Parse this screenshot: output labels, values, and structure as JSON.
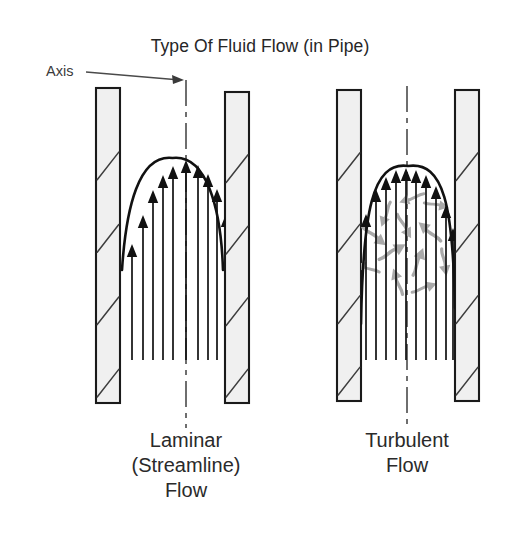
{
  "figure": {
    "title": "Type Of Fluid Flow (in Pipe)",
    "background_color": "#ffffff",
    "ink_color": "#111111",
    "wall_fill_color": "#f0f0f0",
    "eddy_color": "#a9a9a9",
    "axis_annotation": {
      "label": "Axis",
      "label_x": 46,
      "label_y": 76,
      "leader_from_x": 86,
      "leader_from_y": 72,
      "leader_to_x": 184,
      "leader_to_y": 80,
      "arrow": "leader-arrowhead"
    },
    "panels": [
      {
        "id": "laminar",
        "caption_lines": [
          "Laminar",
          "(Streamline)",
          "Flow"
        ],
        "caption_x": 186,
        "caption_y": 447,
        "caption_line_height": 25,
        "flow_regime": "laminar",
        "profile_shape": "parabolic",
        "axis_x": 186,
        "axis_top_y": 80,
        "axis_bottom_y": 428,
        "wall_left": {
          "x": 96,
          "y": 88,
          "width": 24,
          "height": 315,
          "hatch_lines": 4
        },
        "wall_right": {
          "x": 225,
          "y": 92,
          "width": 24,
          "height": 311,
          "hatch_lines": 4
        },
        "bore_left_x": 120,
        "bore_right_x": 225,
        "profile_baseline_y": 270,
        "profile_peak_y": 158,
        "arrow_base_y": 270,
        "arrow_count": 11,
        "arrows": [
          {
            "x": 132,
            "tip_y": 244
          },
          {
            "x": 143,
            "tip_y": 215
          },
          {
            "x": 153,
            "tip_y": 190
          },
          {
            "x": 163,
            "tip_y": 175
          },
          {
            "x": 173,
            "tip_y": 166
          },
          {
            "x": 186,
            "tip_y": 160
          },
          {
            "x": 198,
            "tip_y": 165
          },
          {
            "x": 208,
            "tip_y": 174
          },
          {
            "x": 217,
            "tip_y": 189
          },
          {
            "x": 226,
            "tip_y": 214
          },
          {
            "x": 237,
            "tip_y": 243
          }
        ],
        "eddies": []
      },
      {
        "id": "turbulent",
        "caption_lines": [
          "Turbulent",
          "Flow"
        ],
        "caption_x": 407,
        "caption_y": 447,
        "caption_line_height": 25,
        "flow_regime": "turbulent",
        "profile_shape": "blunt",
        "axis_x": 407,
        "axis_top_y": 86,
        "axis_bottom_y": 428,
        "wall_left": {
          "x": 337,
          "y": 90,
          "width": 24,
          "height": 311,
          "hatch_lines": 4
        },
        "wall_right": {
          "x": 455,
          "y": 90,
          "width": 24,
          "height": 311,
          "hatch_lines": 4
        },
        "bore_left_x": 361,
        "bore_right_x": 455,
        "profile_baseline_y": 290,
        "profile_peak_y": 166,
        "arrow_base_y": 290,
        "arrow_count": 11,
        "arrows": [
          {
            "x": 366,
            "tip_y": 214
          },
          {
            "x": 376,
            "tip_y": 189
          },
          {
            "x": 386,
            "tip_y": 177
          },
          {
            "x": 396,
            "tip_y": 170
          },
          {
            "x": 406,
            "tip_y": 168
          },
          {
            "x": 416,
            "tip_y": 170
          },
          {
            "x": 426,
            "tip_y": 175
          },
          {
            "x": 436,
            "tip_y": 186
          },
          {
            "x": 446,
            "tip_y": 205
          },
          {
            "x": 453,
            "tip_y": 228
          },
          {
            "x": 459,
            "tip_y": 255
          }
        ],
        "eddies": [
          {
            "x": 374,
            "y": 236,
            "angle": 128,
            "scale": 1.0
          },
          {
            "x": 386,
            "y": 214,
            "angle": 200,
            "scale": 0.9
          },
          {
            "x": 392,
            "y": 252,
            "angle": 60,
            "scale": 1.05
          },
          {
            "x": 404,
            "y": 226,
            "angle": 150,
            "scale": 0.95
          },
          {
            "x": 412,
            "y": 198,
            "angle": 250,
            "scale": 0.9
          },
          {
            "x": 418,
            "y": 262,
            "angle": 20,
            "scale": 1.0
          },
          {
            "x": 430,
            "y": 232,
            "angle": 310,
            "scale": 1.0
          },
          {
            "x": 436,
            "y": 205,
            "angle": 100,
            "scale": 0.85
          },
          {
            "x": 398,
            "y": 282,
            "angle": 340,
            "scale": 0.95
          },
          {
            "x": 424,
            "y": 288,
            "angle": 70,
            "scale": 0.9
          },
          {
            "x": 444,
            "y": 262,
            "angle": 170,
            "scale": 0.95
          },
          {
            "x": 368,
            "y": 268,
            "angle": 290,
            "scale": 0.85
          }
        ]
      }
    ]
  },
  "chart_data": {
    "type": "line",
    "title": "Type Of Fluid Flow (in Pipe)",
    "xlabel": "Radial position across pipe",
    "ylabel": "Velocity magnitude (arrow length)",
    "grid": false,
    "legend_position": "none",
    "annotations": [
      "Axis",
      "Laminar (Streamline) Flow",
      "Turbulent Flow"
    ],
    "series": [
      {
        "name": "Laminar (Streamline) Flow",
        "categories": [
          "wall",
          "-0.8",
          "-0.6",
          "-0.4",
          "-0.2",
          "center",
          "0.2",
          "0.4",
          "0.6",
          "0.8",
          "wall"
        ],
        "values": [
          26,
          55,
          80,
          95,
          104,
          110,
          105,
          96,
          81,
          56,
          27
        ]
      },
      {
        "name": "Turbulent Flow",
        "categories": [
          "wall",
          "-0.8",
          "-0.6",
          "-0.4",
          "-0.2",
          "center",
          "0.2",
          "0.4",
          "0.6",
          "0.8",
          "wall"
        ],
        "values": [
          76,
          101,
          113,
          120,
          122,
          120,
          115,
          104,
          85,
          62,
          35
        ]
      }
    ]
  }
}
